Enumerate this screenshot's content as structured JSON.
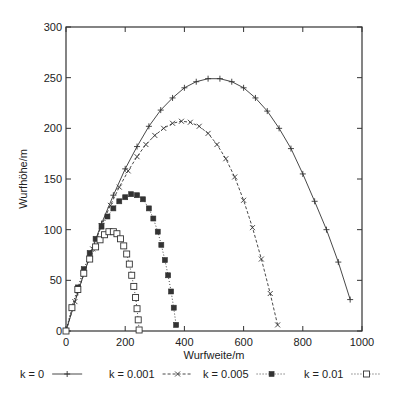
{
  "chart_data": {
    "type": "line",
    "title": "",
    "xlabel": "Wurfweite/m",
    "ylabel": "Wurfhöhe/m",
    "xlim": [
      0,
      1000
    ],
    "ylim": [
      0,
      300
    ],
    "xticks": [
      0,
      200,
      400,
      600,
      800,
      1000
    ],
    "yticks": [
      0,
      50,
      100,
      150,
      200,
      250,
      300
    ],
    "grid": false,
    "legend_position": "bottom",
    "series": [
      {
        "name": "k = 0",
        "line": "solid",
        "marker": "plus",
        "x": [
          0,
          40,
          80,
          120,
          160,
          200,
          240,
          280,
          320,
          360,
          400,
          440,
          480,
          520,
          560,
          600,
          640,
          680,
          720,
          760,
          800,
          840,
          880,
          920,
          960
        ],
        "y": [
          0,
          38,
          74,
          106,
          134,
          160,
          182,
          202,
          218,
          230,
          240,
          246,
          249,
          249,
          246,
          240,
          230,
          217,
          200,
          180,
          155,
          128,
          100,
          68,
          31
        ]
      },
      {
        "name": "k = 0.001",
        "line": "dashed",
        "marker": "cross",
        "x": [
          0,
          30,
          60,
          90,
          120,
          150,
          180,
          210,
          240,
          270,
          300,
          330,
          360,
          390,
          420,
          450,
          480,
          510,
          540,
          570,
          600,
          630,
          660,
          690,
          715
        ],
        "y": [
          0,
          29,
          56,
          81,
          104,
          124,
          142,
          158,
          172,
          184,
          193,
          200,
          205,
          207,
          206,
          202,
          195,
          184,
          170,
          152,
          129,
          102,
          71,
          37,
          6
        ]
      },
      {
        "name": "k = 0.005",
        "line": "dotted",
        "marker": "filled-square",
        "x": [
          0,
          20,
          40,
          60,
          80,
          100,
          120,
          140,
          160,
          180,
          200,
          220,
          240,
          260,
          280,
          295,
          310,
          322,
          334,
          345,
          355,
          364,
          372
        ],
        "y": [
          0,
          23,
          43,
          61,
          77,
          91,
          103,
          113,
          121,
          128,
          132,
          135,
          134,
          130,
          121,
          111,
          98,
          85,
          70,
          55,
          39,
          23,
          6
        ]
      },
      {
        "name": "k = 0.01",
        "line": "dotted",
        "marker": "open-square",
        "x": [
          0,
          20,
          40,
          60,
          80,
          100,
          115,
          130,
          145,
          160,
          172,
          184,
          195,
          205,
          214,
          222,
          229,
          235,
          240,
          244,
          247
        ],
        "y": [
          0,
          23,
          41,
          57,
          71,
          83,
          90,
          95,
          98,
          98,
          96,
          91,
          84,
          76,
          66,
          55,
          44,
          33,
          22,
          11,
          1
        ]
      }
    ]
  },
  "axes": {
    "xlabel": "Wurfweite/m",
    "ylabel": "Wurfhöhe/m",
    "xtick_labels": [
      "0",
      "200",
      "400",
      "600",
      "800",
      "1000"
    ],
    "ytick_labels": [
      "0",
      "50",
      "100",
      "150",
      "200",
      "250",
      "300"
    ]
  },
  "legend": {
    "items": [
      {
        "label": "k = 0"
      },
      {
        "label": "k = 0.001"
      },
      {
        "label": "k = 0.005"
      },
      {
        "label": "k = 0.01"
      }
    ]
  }
}
